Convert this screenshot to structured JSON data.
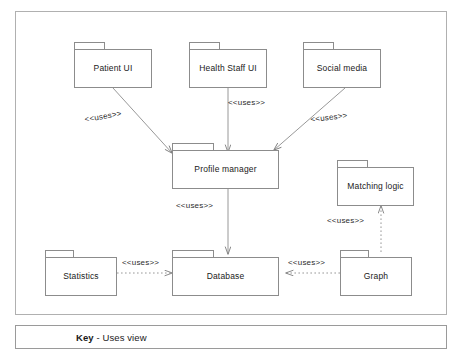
{
  "diagram": {
    "type": "uml-component-uses-view",
    "background": "#ffffff",
    "line_color": "#8c8c8c",
    "frame_color": "#b0b0b0",
    "text_color": "#1a1a1a",
    "legend": {
      "key_word": "Key",
      "separator": " - ",
      "view_name": "Uses view"
    },
    "packages": [
      {
        "id": "patient-ui",
        "label": "Patient UI"
      },
      {
        "id": "health-staff-ui",
        "label": "Health Staff UI"
      },
      {
        "id": "social-media",
        "label": "Social media"
      },
      {
        "id": "profile-manager",
        "label": "Profile manager"
      },
      {
        "id": "matching-logic",
        "label": "Matching logic"
      },
      {
        "id": "statistics",
        "label": "Statistics"
      },
      {
        "id": "database",
        "label": "Database"
      },
      {
        "id": "graph",
        "label": "Graph"
      }
    ],
    "relations": [
      {
        "id": "rel-patient-profile",
        "from": "patient-ui",
        "to": "profile-manager",
        "label": "<<uses>>",
        "style": "solid"
      },
      {
        "id": "rel-staff-profile",
        "from": "health-staff-ui",
        "to": "profile-manager",
        "label": "<<uses>>",
        "style": "solid"
      },
      {
        "id": "rel-social-profile",
        "from": "social-media",
        "to": "profile-manager",
        "label": "<<uses>>",
        "style": "solid"
      },
      {
        "id": "rel-profile-database",
        "from": "profile-manager",
        "to": "database",
        "label": "<<uses>>",
        "style": "solid"
      },
      {
        "id": "rel-stats-database",
        "from": "statistics",
        "to": "database",
        "label": "<<uses>>",
        "style": "dotted"
      },
      {
        "id": "rel-graph-database",
        "from": "graph",
        "to": "database",
        "label": "<<uses>>",
        "style": "dotted"
      },
      {
        "id": "rel-graph-matching",
        "from": "graph",
        "to": "matching-logic",
        "label": "<<uses>>",
        "style": "dotted"
      }
    ]
  }
}
